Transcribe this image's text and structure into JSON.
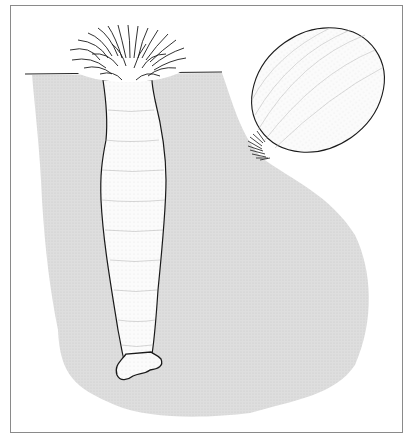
{
  "figure": {
    "labels": [],
    "colors": {
      "sediment": "#dcdcdc",
      "outline": "#1a1a1a",
      "frame": "#8a8a8a",
      "background": "#ffffff"
    },
    "parts": [
      "tentacle-crown",
      "column",
      "physa-base",
      "ground-line",
      "sediment-burrow",
      "retracted-anemone",
      "retracted-tentacles"
    ]
  }
}
